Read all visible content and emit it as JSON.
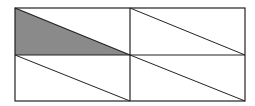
{
  "diagram": {
    "grid": {
      "rows": 2,
      "cols": 2
    },
    "shaded_region": {
      "cell": [
        0,
        0
      ],
      "part": "lower-left triangle"
    },
    "colors": {
      "stroke": "#222222",
      "shade": "#8a8a8a",
      "background": "#ffffff"
    }
  }
}
